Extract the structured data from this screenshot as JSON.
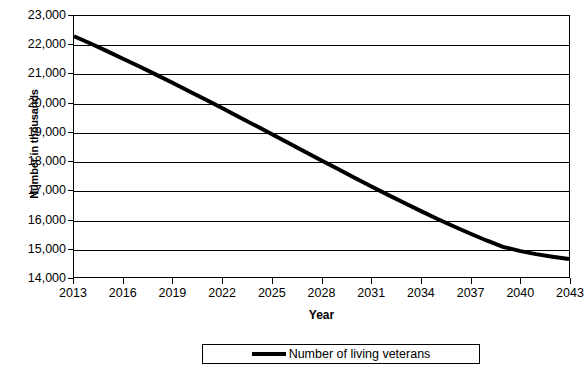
{
  "chart_data": {
    "type": "line",
    "title": "",
    "xlabel": "Year",
    "ylabel": "Number in thousands",
    "xlim": [
      2013,
      2043
    ],
    "ylim": [
      14000,
      23000
    ],
    "ytick_step": 1000,
    "xtick_step": 3,
    "grid": true,
    "legend_position": "bottom-center",
    "y_ticks": [
      "23,000",
      "22,000",
      "21,000",
      "20,000",
      "19,000",
      "18,000",
      "17,000",
      "16,000",
      "15,000",
      "14,000"
    ],
    "y_tick_values": [
      23000,
      22000,
      21000,
      20000,
      19000,
      18000,
      17000,
      16000,
      15000,
      14000
    ],
    "x_ticks": [
      "2013",
      "2016",
      "2019",
      "2022",
      "2025",
      "2028",
      "2031",
      "2034",
      "2037",
      "2040",
      "2043"
    ],
    "x_tick_values": [
      2013,
      2016,
      2019,
      2022,
      2025,
      2028,
      2031,
      2034,
      2037,
      2040,
      2043
    ],
    "series": [
      {
        "name": "Number of living veterans",
        "color": "#000000",
        "line_width": 4,
        "x": [
          2013,
          2014,
          2015,
          2016,
          2017,
          2018,
          2019,
          2020,
          2021,
          2022,
          2023,
          2024,
          2025,
          2026,
          2027,
          2028,
          2029,
          2030,
          2031,
          2032,
          2033,
          2034,
          2035,
          2036,
          2037,
          2038,
          2039,
          2040,
          2041,
          2042,
          2043
        ],
        "values": [
          22300,
          22050,
          21790,
          21520,
          21250,
          20970,
          20690,
          20400,
          20110,
          19820,
          19520,
          19220,
          18920,
          18620,
          18320,
          18020,
          17720,
          17420,
          17130,
          16840,
          16560,
          16280,
          16010,
          15750,
          15500,
          15260,
          15040,
          14900,
          14790,
          14700,
          14620
        ]
      }
    ]
  },
  "legend": {
    "entry_label": "Number of living veterans"
  },
  "axes": {
    "x_title": "Year",
    "y_title": "Number in thousands"
  }
}
